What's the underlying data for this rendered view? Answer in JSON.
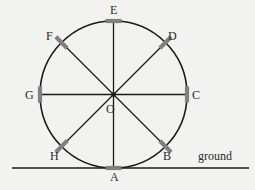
{
  "figure": {
    "background_color": "#f2f2f0",
    "stroke_color": "#1a1a1a",
    "tick_color": "#808080",
    "label_color": "#2b2b2b",
    "circle": {
      "center_label": "O",
      "center_x": 113.5,
      "center_y": 94.5,
      "radius": 73.5
    },
    "ground": {
      "label": "ground",
      "y": 168,
      "x_start": 12,
      "x_end": 249
    },
    "points": [
      {
        "label": "A",
        "angle_deg": 270,
        "x": 113.5,
        "y": 168.0,
        "label_x": 110,
        "label_y": 171,
        "tick_rot": 0
      },
      {
        "label": "B",
        "angle_deg": 315,
        "x": 165.5,
        "y": 146.5,
        "label_x": 163,
        "label_y": 150,
        "tick_rot": 45
      },
      {
        "label": "C",
        "angle_deg": 0,
        "x": 187.0,
        "y": 94.5,
        "label_x": 192,
        "label_y": 89,
        "tick_rot": 90
      },
      {
        "label": "D",
        "angle_deg": 45,
        "x": 165.5,
        "y": 42.5,
        "label_x": 168,
        "label_y": 30,
        "tick_rot": 135
      },
      {
        "label": "E",
        "angle_deg": 90,
        "x": 113.5,
        "y": 21.0,
        "label_x": 110,
        "label_y": 4,
        "tick_rot": 0
      },
      {
        "label": "F",
        "angle_deg": 135,
        "x": 61.5,
        "y": 42.5,
        "label_x": 46,
        "label_y": 30,
        "tick_rot": 45
      },
      {
        "label": "G",
        "angle_deg": 180,
        "x": 40.0,
        "y": 94.5,
        "label_x": 25,
        "label_y": 89,
        "tick_rot": 90
      },
      {
        "label": "H",
        "angle_deg": 225,
        "x": 61.5,
        "y": 146.5,
        "label_x": 50,
        "label_y": 150,
        "tick_rot": 135
      }
    ],
    "diameters": [
      {
        "name": "A-E",
        "from": "A",
        "to": "E"
      },
      {
        "name": "B-F",
        "from": "B",
        "to": "F"
      },
      {
        "name": "C-G",
        "from": "C",
        "to": "G"
      },
      {
        "name": "D-H",
        "from": "D",
        "to": "H"
      }
    ],
    "center_dot": {
      "label": "O",
      "label_x": 106,
      "label_y": 103
    }
  }
}
